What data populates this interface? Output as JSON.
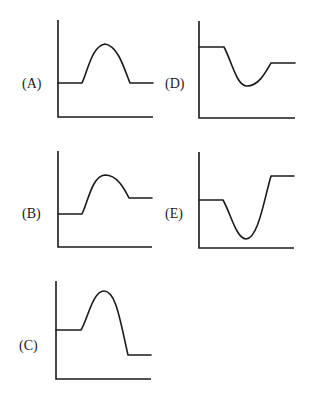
{
  "figure": {
    "panels": [
      {
        "id": "A",
        "label": "(A)",
        "shape": "peak",
        "start_level": "middle",
        "end_level": "same as start"
      },
      {
        "id": "B",
        "label": "(B)",
        "shape": "peak",
        "start_level": "lower",
        "end_level": "higher than start"
      },
      {
        "id": "C",
        "label": "(C)",
        "shape": "peak",
        "start_level": "middle",
        "end_level": "lower than start"
      },
      {
        "id": "D",
        "label": "(D)",
        "shape": "valley",
        "start_level": "high",
        "end_level": "lower than start"
      },
      {
        "id": "E",
        "label": "(E)",
        "shape": "valley",
        "start_level": "middle",
        "end_level": "higher than start"
      }
    ]
  },
  "labels": {
    "A": "(A)",
    "B": "(B)",
    "C": "(C)",
    "D": "(D)",
    "E": "(E)"
  },
  "colors": {
    "line": "#1a1a1a",
    "background": "#ffffff"
  }
}
